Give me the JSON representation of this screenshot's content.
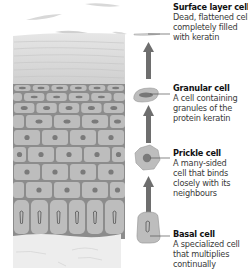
{
  "diagram": {
    "colors": {
      "cell_fill": "#bdbdbd",
      "cell_border": "#8c8c8c",
      "nucleus": "#7a7a7a",
      "arrow": "#6e6e6e",
      "dermis": "#ececec",
      "surface": "#d6d6d6"
    },
    "labels": [
      {
        "id": "surface",
        "title": "Surface layer cell",
        "description_lines": [
          "Dead, flattened cell",
          "completely filled",
          "with keratin"
        ]
      },
      {
        "id": "granular",
        "title": "Granular cell",
        "description_lines": [
          "A cell containing",
          "granules of the",
          "protein keratin"
        ]
      },
      {
        "id": "prickle",
        "title": "Prickle cell",
        "description_lines": [
          "A many-sided",
          "cell that binds",
          "closely with its",
          "neighbours"
        ]
      },
      {
        "id": "basal",
        "title": "Basal cell",
        "description_lines": [
          "A specialized cell",
          "that multiplies",
          "continually"
        ]
      }
    ],
    "arrows": [
      {
        "direction": "up",
        "from": "granular",
        "to": "surface"
      },
      {
        "direction": "up",
        "from": "prickle",
        "to": "granular"
      },
      {
        "direction": "up",
        "from": "basal",
        "to": "prickle"
      }
    ]
  }
}
